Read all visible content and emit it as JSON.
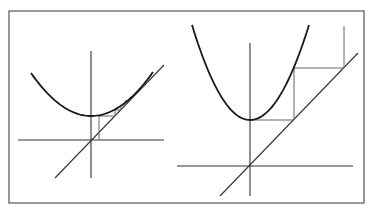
{
  "figure": {
    "frame": {
      "x": 9,
      "y": 11,
      "width": 355,
      "height": 192,
      "stroke": "#555555"
    },
    "colors": {
      "curve": "#1a1a1a",
      "axis": "#333333",
      "cobweb": "#666666",
      "background": "#ffffff"
    }
  },
  "panels": [
    {
      "id": "left",
      "caption": "",
      "x_axis": {
        "x1": 18,
        "y1": 140,
        "x2": 164,
        "y2": 140
      },
      "y_axis": {
        "x1": 91,
        "y1": 51,
        "x2": 91,
        "y2": 178
      },
      "diagonal": {
        "x1": 55,
        "y1": 178,
        "x2": 164,
        "y2": 65
      },
      "parabola": {
        "x_left": 31,
        "y_left": 73,
        "vx": 91,
        "vy": 116,
        "x_right": 153,
        "y_right": 72
      },
      "cobweb_path": "M99,140 L99,116 L115,116 L115,110 L121,110 L121,105 L125,105 L125,101 L128,101"
    },
    {
      "id": "right",
      "caption": "",
      "x_axis": {
        "x1": 177,
        "y1": 166,
        "x2": 353,
        "y2": 166
      },
      "y_axis": {
        "x1": 250,
        "y1": 43,
        "x2": 250,
        "y2": 196
      },
      "diagonal": {
        "x1": 220,
        "y1": 196,
        "x2": 358,
        "y2": 53
      },
      "parabola": {
        "x_left": 192,
        "y_left": 25,
        "vx": 250,
        "vy": 120,
        "x_right": 309,
        "y_right": 25
      },
      "cobweb_path": "M250,120 L294,120 L294,68 L344,68 L344,26"
    }
  ]
}
